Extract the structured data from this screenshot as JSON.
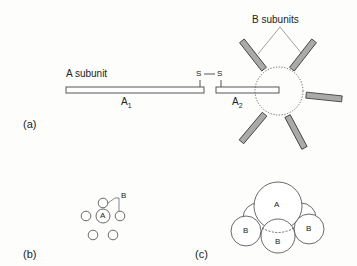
{
  "figure": {
    "panel_a": {
      "label": "(a)",
      "a_subunit_label": "A subunit",
      "a1_label": "A1",
      "a2_label": "A2",
      "s_left": "S",
      "s_right": "S",
      "b_subunits_label": "B subunits"
    },
    "panel_b": {
      "label": "(b)",
      "a_label": "A",
      "b_label": "B"
    },
    "panel_c": {
      "label": "(c)",
      "a_label": "A",
      "b_left": "B",
      "b_center": "B",
      "b_right": "B"
    }
  }
}
